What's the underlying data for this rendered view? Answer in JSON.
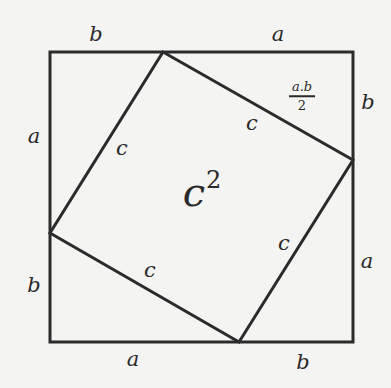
{
  "diagram": {
    "outer_square": {
      "x1": 50,
      "y1": 52,
      "x2": 353,
      "y2": 342
    },
    "inner_square": [
      [
        163,
        52
      ],
      [
        353,
        160
      ],
      [
        239,
        342
      ],
      [
        50,
        233
      ]
    ],
    "line_color": "#2b2b2b",
    "labels": {
      "top_left": "b",
      "top_right": "a",
      "right_top": "b",
      "right_bottom": "a",
      "bottom_right": "b",
      "bottom_left": "a",
      "left_bottom": "b",
      "left_top": "a",
      "hyp_top_left": "c",
      "hyp_top_right": "c",
      "hyp_bottom_right": "c",
      "hyp_bottom_left": "c",
      "center_base": "c",
      "center_exp": "2",
      "area_num": "a.b",
      "area_den": "2"
    }
  }
}
